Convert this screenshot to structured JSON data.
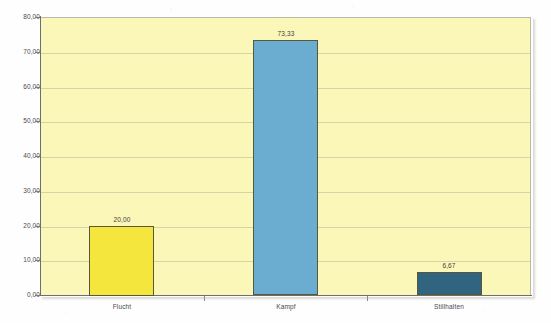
{
  "chart_data": {
    "type": "bar",
    "title": "",
    "subtitle": "",
    "xlabel": "",
    "ylabel": "",
    "categories": [
      "Flucht",
      "Kampf",
      "Stillhalten"
    ],
    "values": [
      20.0,
      73.33,
      6.67
    ],
    "value_labels": [
      "20,00",
      "73,33",
      "6,67"
    ],
    "bar_colors": [
      "#f5e63d",
      "#6badd0",
      "#31647f"
    ],
    "bar_border_color": "#55583a",
    "ylim": [
      0,
      80
    ],
    "ytick_step": 10,
    "ytick_labels": [
      "80,00",
      "70,00",
      "60,00",
      "50,00",
      "40,00",
      "30,00",
      "20,00",
      "10,00",
      "0,00"
    ],
    "ytick_values": [
      80,
      70,
      60,
      50,
      40,
      30,
      20,
      10,
      0
    ],
    "grid": true,
    "grid_axis": "y",
    "grid_color": "#c9c79f",
    "legend": false,
    "legend_position": "none",
    "plot_background": "#fbf7b8",
    "figure_background": "#ffffff",
    "axis_color": "#6e6e6e",
    "decimal_separator": ","
  }
}
